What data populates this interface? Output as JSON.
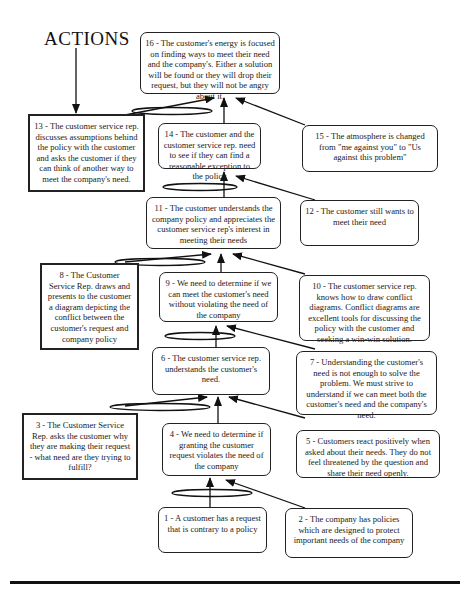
{
  "title": "ACTIONS",
  "nodes": {
    "n1": "1 - A customer has a request that is contrary to a policy",
    "n2": "2 - The company has policies which are designed to protect important needs of the company",
    "n3": "3 - The Customer Service Rep. asks the customer why they are making their request - what need are they trying to fulfill?",
    "n4": "4 - We need to determine if granting the customer request violates the need of the company",
    "n5": "5 - Customers react positively when asked about their needs. They do not feel threatened by the question and share their need openly.",
    "n6": "6 - The customer service rep. understands the customer's need.",
    "n7": "7 - Understanding the customer's need is not enough to solve the problem. We must strive to understand if we can meet both the customer's need and the company's need.",
    "n8": "8 - The Customer Service Rep. draws and presents to the customer a diagram depicting the conflict between the customer's request and company policy",
    "n9": "9 - We need to determine if we can meet the customer's need without violating the need of the company",
    "n10": "10 - The customer service rep. knows how to draw conflict diagrams. Conflict diagrams are excellent tools for discussing the policy with the customer and seeking a win-win solution.",
    "n11": "11 - The customer understands the company policy and appreciates the customer service rep's interest in meeting their needs",
    "n12": "12 - The customer still wants to meet their need",
    "n13": "13 - The customer service rep. discusses assumptions behind the policy with the customer and asks the customer if they can think of another way to meet the company's need.",
    "n14": "14 - The customer and the customer service rep. need to see if they can find a reasonable exception to the policy",
    "n15": "15 - The atmosphere is changed from \"me against you\" to \"Us against this problem\"",
    "n16": "16 - The customer's energy is focused on finding ways to meet their need and the company's. Either a solution will be found or they will drop their request, but they will not be angry about it."
  },
  "legend": {
    "action_box_style": "square thick border",
    "effect_box_style": "rounded border",
    "and_connector": "ellipse"
  }
}
